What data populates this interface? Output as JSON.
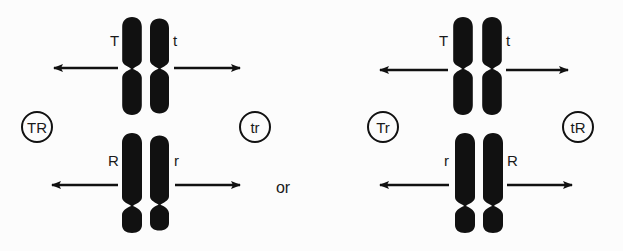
{
  "diagram": {
    "type": "independent-assortment",
    "colors": {
      "ink": "#111111",
      "background": "#fcfcfc"
    },
    "left_panel": {
      "top_pair": {
        "left_allele": "T",
        "right_allele": "t"
      },
      "bottom_pair": {
        "left_allele": "R",
        "right_allele": "r"
      },
      "gametes": {
        "left": "TR",
        "right": "tr"
      }
    },
    "separator": "or",
    "right_panel": {
      "top_pair": {
        "left_allele": "T",
        "right_allele": "t"
      },
      "bottom_pair": {
        "left_allele": "r",
        "right_allele": "R"
      },
      "gametes": {
        "left": "Tr",
        "right": "tR"
      }
    },
    "icons": {
      "arrow_left": "arrow-left-icon",
      "arrow_right": "arrow-right-icon",
      "chromosome": "chromosome-icon",
      "gamete_circle": "circle-icon"
    }
  }
}
